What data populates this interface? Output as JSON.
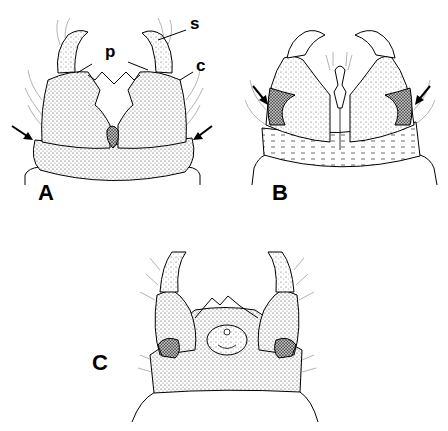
{
  "figure": {
    "panels": [
      {
        "id": "A",
        "label": "A"
      },
      {
        "id": "B",
        "label": "B"
      },
      {
        "id": "C",
        "label": "C"
      }
    ],
    "annotations": {
      "s": "s",
      "p": "p",
      "c": "c"
    },
    "arrows": {
      "panel_A": 2,
      "panel_B": 2
    },
    "colors": {
      "ink": "#000000",
      "stipple_dark": "#3a3a3a",
      "stipple_mid": "#8a8a8a",
      "background": "#ffffff"
    }
  }
}
